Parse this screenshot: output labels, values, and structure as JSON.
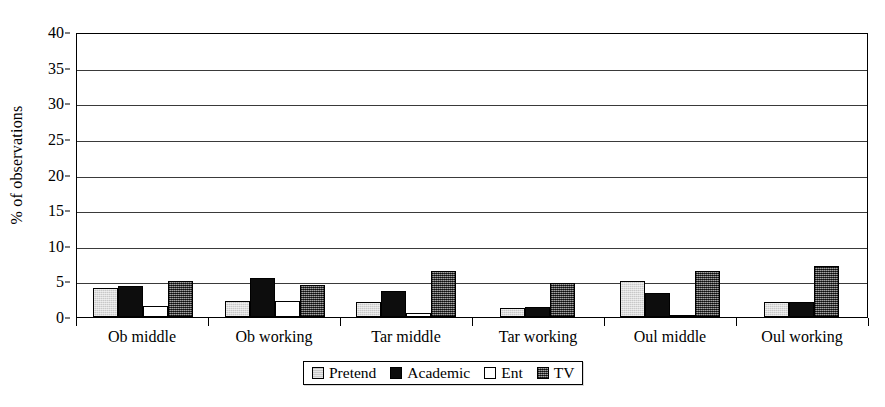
{
  "chart_data": {
    "type": "bar",
    "title": "",
    "xlabel": "",
    "ylabel": "% of observations",
    "ylim": [
      0,
      40
    ],
    "yticks": [
      0,
      5,
      10,
      15,
      20,
      25,
      30,
      35,
      40
    ],
    "grid": true,
    "legend_position": "bottom",
    "categories": [
      "Ob middle",
      "Ob working",
      "Tar middle",
      "Tar working",
      "Oul middle",
      "Oul working"
    ],
    "series": [
      {
        "name": "Pretend",
        "color": "#c8c8c8",
        "values": [
          4.1,
          2.2,
          2.1,
          1.2,
          5.0,
          2.1
        ]
      },
      {
        "name": "Academic",
        "color": "#0d0d0d",
        "values": [
          4.4,
          5.5,
          3.6,
          1.4,
          3.4,
          2.1
        ]
      },
      {
        "name": "Ent",
        "color": "#ffffff",
        "values": [
          1.6,
          2.3,
          0.5,
          0.0,
          0.3,
          0.0
        ]
      },
      {
        "name": "TV",
        "color": "#555555",
        "values": [
          5.0,
          4.5,
          6.5,
          4.8,
          6.5,
          7.2
        ]
      }
    ]
  },
  "legend": {
    "items": [
      {
        "label": "Pretend",
        "swatch": "series-pretend"
      },
      {
        "label": "Academic",
        "swatch": "series-academic"
      },
      {
        "label": "Ent",
        "swatch": "series-ent"
      },
      {
        "label": "TV",
        "swatch": "series-tv"
      }
    ]
  }
}
